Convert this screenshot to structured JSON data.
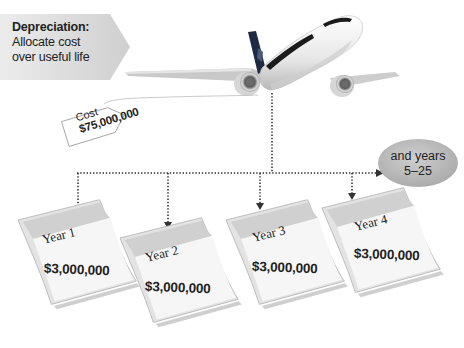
{
  "header_label": {
    "title": "Depreciation:",
    "line1": "Allocate cost",
    "line2": "over useful life"
  },
  "price_tag": {
    "label": "Cost",
    "amount": "$75,000,000"
  },
  "remaining_years": {
    "line1": "and years",
    "line2": "5–25"
  },
  "calendars": [
    {
      "year_label": "Year 1",
      "amount": "$3,000,000"
    },
    {
      "year_label": "Year 2",
      "amount": "$3,000,000"
    },
    {
      "year_label": "Year 3",
      "amount": "$3,000,000"
    },
    {
      "year_label": "Year 4",
      "amount": "$3,000,000"
    }
  ],
  "colors": {
    "label_box": "#d9d9d9",
    "oval": "#bdbdbd",
    "calendar_header": "#d4d4d4",
    "calendar_grid": "#f4f4f4",
    "plane_tail": "#1e2a44",
    "dotted_line": "#333333"
  }
}
